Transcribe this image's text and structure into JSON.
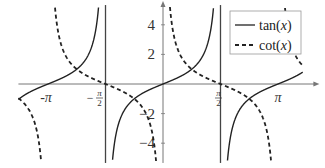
{
  "chart_data": {
    "type": "line",
    "title": "",
    "xlabel": "",
    "ylabel": "",
    "xlim": [
      -3.95,
      4.0
    ],
    "ylim": [
      -5.2,
      5.2
    ],
    "grid": false,
    "legend_position": "upper right",
    "x_ticks": [
      {
        "value": -3.14159,
        "label": "-π"
      },
      {
        "value": -1.5708,
        "label": "-π/2",
        "num": "π",
        "den": "2",
        "sign": "−"
      },
      {
        "value": 1.5708,
        "label": "π/2",
        "num": "π",
        "den": "2",
        "sign": ""
      },
      {
        "value": 3.14159,
        "label": "π"
      }
    ],
    "y_ticks": [
      {
        "value": 4,
        "label": "4"
      },
      {
        "value": 2,
        "label": "2"
      },
      {
        "value": -2,
        "label": "−2"
      },
      {
        "value": -4,
        "label": "−4"
      }
    ],
    "vertical_lines": [
      -1.5708,
      1.5708
    ],
    "series": [
      {
        "name": "tan(x)",
        "function": "tan",
        "style": "solid",
        "color": "#222222"
      },
      {
        "name": "cot(x)",
        "function": "cot",
        "style": "dashed",
        "color": "#222222"
      }
    ],
    "legend": [
      {
        "label_fn": "tan",
        "label_arg": "x",
        "style": "solid"
      },
      {
        "label_fn": "cot",
        "label_arg": "x",
        "style": "dashed"
      }
    ]
  },
  "layout": {
    "origin_px": [
      163,
      84
    ],
    "px_per_unit_x": 36.6,
    "px_per_unit_y": 14.8,
    "axis_color": "#777777",
    "curve_color": "#222222"
  }
}
